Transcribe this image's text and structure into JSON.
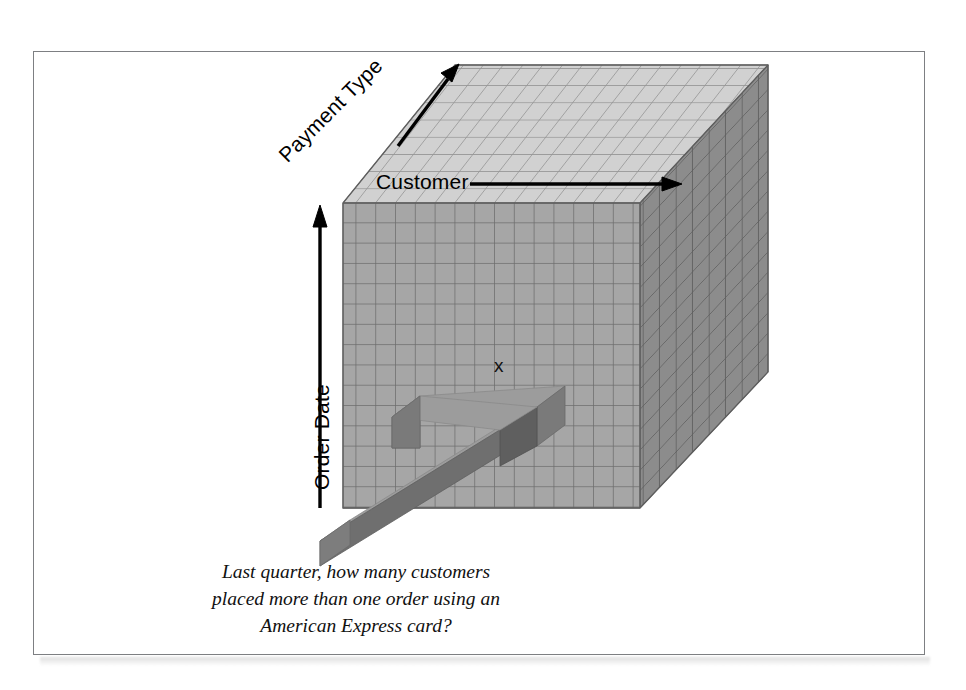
{
  "figure": {
    "kind": "olap-data-cube-illustration",
    "frame": {
      "border_color": "#7d7f82",
      "background": "#ffffff"
    }
  },
  "axes": {
    "customer": {
      "label": "Customer",
      "arrow": "right-arrow-icon",
      "direction": "right"
    },
    "payment_type": {
      "label": "Payment Type",
      "arrow": "up-right-arrow-icon",
      "direction": "up-right"
    },
    "order_date": {
      "label": "Order Date",
      "arrow": "up-arrow-icon",
      "direction": "up"
    }
  },
  "cube": {
    "front_face": {
      "color": "#a6a6a6",
      "grid_line_color": "#6d6d6d",
      "columns": 15,
      "rows": 15
    },
    "top_face": {
      "color": "#cfcfcf",
      "grid_line_color": "#8a8a8a",
      "columns": 15,
      "rows": 8
    },
    "right_face": {
      "color": "#8c8c8c",
      "grid_line_color": "#5a5a5a",
      "columns": 8,
      "rows": 15
    },
    "cell_marker": {
      "text": "x"
    }
  },
  "pointer": {
    "name": "drill-down-arrow",
    "shaft_color": "#9a9a9a",
    "side_color": "#6f6f6f",
    "head_color": "#7a7a7a",
    "direction": "up-right"
  },
  "caption": {
    "line1": "Last quarter, how many customers",
    "line2": "placed more than one order using an",
    "line3": "American Express card?"
  }
}
